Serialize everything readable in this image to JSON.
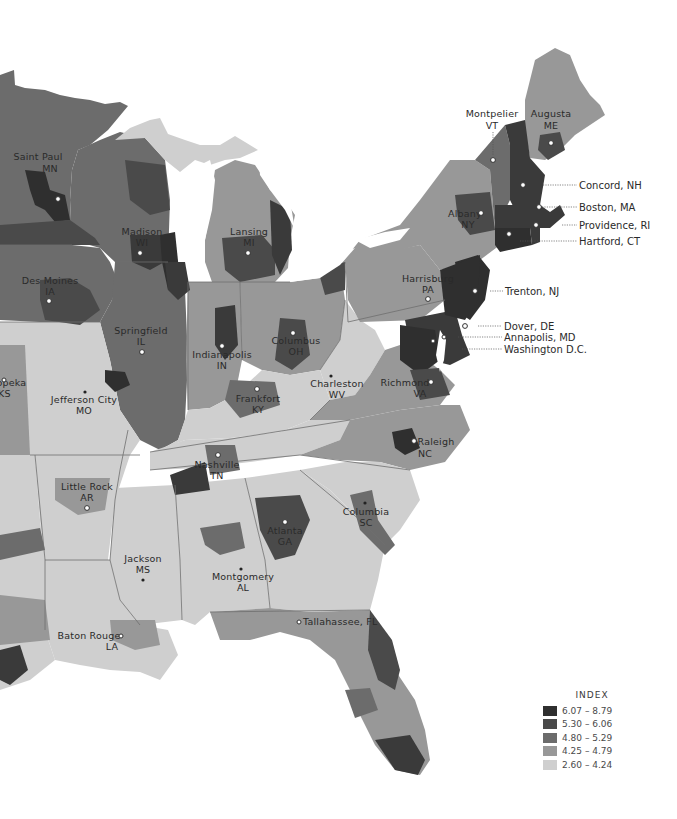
{
  "map": {
    "type": "choropleth",
    "region": "Eastern United States",
    "legend": {
      "title": "INDEX",
      "classes": [
        {
          "label": "6.07 – 8.79",
          "color": "#2f2f2f"
        },
        {
          "label": "5.30 – 6.06",
          "color": "#4a4a4a"
        },
        {
          "label": "4.80 – 5.29",
          "color": "#6c6c6c"
        },
        {
          "label": "4.25 – 4.79",
          "color": "#989898"
        },
        {
          "label": "2.60 – 4.24",
          "color": "#cfcfcf"
        }
      ]
    },
    "capitals": [
      {
        "name": "Saint Paul",
        "state": "MN"
      },
      {
        "name": "Madison",
        "state": "WI"
      },
      {
        "name": "Des Moines",
        "state": "IA"
      },
      {
        "name": "Lansing",
        "state": "MI"
      },
      {
        "name": "Springfield",
        "state": "IL"
      },
      {
        "name": "Indianapolis",
        "state": "IN"
      },
      {
        "name": "Columbus",
        "state": "OH"
      },
      {
        "name": "Jefferson City",
        "state": "MO"
      },
      {
        "name": "Frankfort",
        "state": "KY"
      },
      {
        "name": "Charleston",
        "state": "WV"
      },
      {
        "name": "Richmond",
        "state": "VA"
      },
      {
        "name": "Raleigh",
        "state": "NC"
      },
      {
        "name": "Nashville",
        "state": "TN"
      },
      {
        "name": "Little Rock",
        "state": "AR"
      },
      {
        "name": "Jackson",
        "state": "MS"
      },
      {
        "name": "Montgomery",
        "state": "AL"
      },
      {
        "name": "Atlanta",
        "state": "GA"
      },
      {
        "name": "Columbia",
        "state": "SC"
      },
      {
        "name": "Tallahassee",
        "state": "FL"
      },
      {
        "name": "Baton Rouge",
        "state": "LA"
      },
      {
        "name": "Harrisburg",
        "state": "PA"
      },
      {
        "name": "Albany",
        "state": "NY"
      },
      {
        "name": "Montpelier",
        "state": "VT"
      },
      {
        "name": "Augusta",
        "state": "ME"
      },
      {
        "name": "Topeka",
        "state": "KS"
      }
    ],
    "callouts": [
      {
        "label": "Concord, NH"
      },
      {
        "label": "Boston, MA"
      },
      {
        "label": "Providence, RI"
      },
      {
        "label": "Hartford, CT"
      },
      {
        "label": "Trenton, NJ"
      },
      {
        "label": "Dover, DE"
      },
      {
        "label": "Annapolis, MD"
      },
      {
        "label": "Washington D.C."
      }
    ]
  },
  "labels": {
    "saint_paul_1": "Saint Paul",
    "saint_paul_2": "MN",
    "madison_1": "Madison",
    "madison_2": "WI",
    "des_moines_1": "Des Moines",
    "des_moines_2": "IA",
    "lansing_1": "Lansing",
    "lansing_2": "MI",
    "springfield_1": "Springfield",
    "springfield_2": "IL",
    "indianapolis_1": "Indianapolis",
    "indianapolis_2": "IN",
    "columbus_1": "Columbus",
    "columbus_2": "OH",
    "jefferson_1": "Jefferson City",
    "jefferson_2": "MO",
    "frankfort_1": "Frankfort",
    "frankfort_2": "KY",
    "charleston_1": "Charleston",
    "charleston_2": "WV",
    "richmond_1": "Richmond",
    "richmond_2": "VA",
    "raleigh_1": "Raleigh",
    "raleigh_2": "NC",
    "nashville_1": "Nashville",
    "nashville_2": "TN",
    "littlerock_1": "Little Rock",
    "littlerock_2": "AR",
    "jackson_1": "Jackson",
    "jackson_2": "MS",
    "montgomery_1": "Montgomery",
    "montgomery_2": "AL",
    "atlanta_1": "Atlanta",
    "atlanta_2": "GA",
    "columbia_1": "Columbia",
    "columbia_2": "SC",
    "tallahassee_1": "Tallahassee, FL",
    "batonrouge_1": "Baton Rouge",
    "batonrouge_2": "LA",
    "harrisburg_1": "Harrisburg",
    "harrisburg_2": "PA",
    "albany_1": "Albany",
    "albany_2": "NY",
    "montpelier_1": "Montpelier",
    "montpelier_2": "VT",
    "augusta_1": "Augusta",
    "augusta_2": "ME",
    "topeka_1": "Topeka",
    "topeka_2": "KS",
    "concord": "Concord, NH",
    "boston": "Boston, MA",
    "providence": "Providence, RI",
    "hartford": "Hartford, CT",
    "trenton": "Trenton, NJ",
    "dover": "Dover, DE",
    "annapolis": "Annapolis, MD",
    "washington": "Washington D.C."
  }
}
